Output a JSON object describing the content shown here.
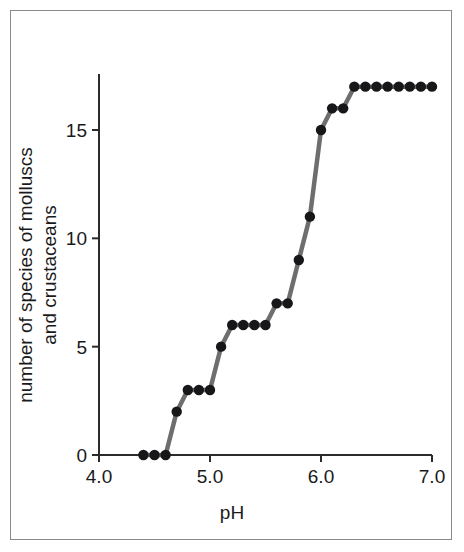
{
  "figure": {
    "frame_border_color": "#8a8a8a",
    "background_color": "#ffffff"
  },
  "chart_data": {
    "type": "line",
    "title": "",
    "subtitle": "",
    "xlabel": "pH",
    "ylabel": "number of species of molluscs and crustaceans",
    "ylabel_line1": "number of species of molluscs",
    "ylabel_line2": "and crustaceans",
    "xlim": [
      4.0,
      7.0
    ],
    "ylim": [
      0,
      17.6
    ],
    "xticks": [
      4.0,
      5.0,
      6.0,
      7.0
    ],
    "xtick_labels": [
      "4.0",
      "5.0",
      "6.0",
      "7.0"
    ],
    "yticks": [
      0,
      5,
      10,
      15
    ],
    "ytick_labels": [
      "0",
      "5",
      "10",
      "15"
    ],
    "grid": false,
    "legend": null,
    "legend_position": "none",
    "marker": "filled-circle",
    "marker_color": "#17171a",
    "line_color": "#6e6e6e",
    "x": [
      4.4,
      4.5,
      4.6,
      4.7,
      4.8,
      4.9,
      5.0,
      5.1,
      5.2,
      5.3,
      5.4,
      5.5,
      5.6,
      5.7,
      5.8,
      5.9,
      6.0,
      6.1,
      6.2,
      6.3,
      6.4,
      6.5,
      6.6,
      6.7,
      6.8,
      6.9,
      7.0
    ],
    "y": [
      0,
      0,
      0,
      2,
      3,
      3,
      3,
      5,
      6,
      6,
      6,
      6,
      7,
      7,
      9,
      11,
      15,
      16,
      16,
      17,
      17,
      17,
      17,
      17,
      17,
      17,
      17
    ],
    "series": [
      {
        "name": "number of species of molluscs and crustaceans",
        "values": [
          0,
          0,
          0,
          2,
          3,
          3,
          3,
          5,
          6,
          6,
          6,
          6,
          7,
          7,
          9,
          11,
          15,
          16,
          16,
          17,
          17,
          17,
          17,
          17,
          17,
          17,
          17
        ]
      }
    ],
    "annotations": []
  }
}
